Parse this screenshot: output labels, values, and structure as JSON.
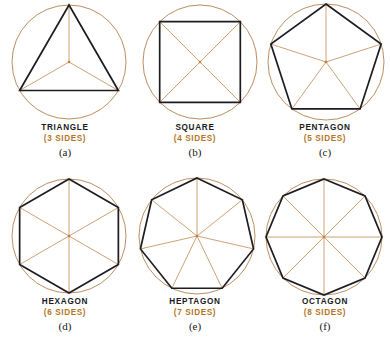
{
  "figure": {
    "background_color": "#ffffff",
    "circle_color": "#b07a44",
    "polygon_color": "#1c1c22",
    "radius_color": "#c08a52",
    "label_color": "#1a1a1a",
    "sides_label_color": "#b5761f",
    "panels": [
      {
        "id": "triangle",
        "name": "TRIANGLE",
        "sides_label": "(3 SIDES)",
        "letter": "(a)",
        "sides": 3,
        "center_x": 69,
        "center_y": 62,
        "radius": 57,
        "rotation_deg": -90,
        "show_radii": true
      },
      {
        "id": "square",
        "name": "SQUARE",
        "sides_label": "(4 SIDES)",
        "letter": "(b)",
        "sides": 4,
        "center_x": 70,
        "center_y": 62,
        "radius": 57,
        "rotation_deg": -135,
        "show_radii": true
      },
      {
        "id": "pentagon",
        "name": "PENTAGON",
        "sides_label": "(5 SIDES)",
        "letter": "(c)",
        "sides": 5,
        "center_x": 66,
        "center_y": 62,
        "radius": 58,
        "rotation_deg": -90,
        "show_radii": true
      },
      {
        "id": "hexagon",
        "name": "HEXAGON",
        "sides_label": "(6 SIDES)",
        "letter": "(d)",
        "sides": 6,
        "center_x": 69,
        "center_y": 62,
        "radius": 57,
        "rotation_deg": -90,
        "show_radii": true
      },
      {
        "id": "heptagon",
        "name": "HEPTAGON",
        "sides_label": "(7 SIDES)",
        "letter": "(e)",
        "sides": 7,
        "center_x": 67,
        "center_y": 62,
        "radius": 58,
        "rotation_deg": -90,
        "show_radii": true
      },
      {
        "id": "octagon",
        "name": "OCTAGON",
        "sides_label": "(8 SIDES)",
        "letter": "(f)",
        "sides": 8,
        "center_x": 64,
        "center_y": 63,
        "radius": 58,
        "rotation_deg": -90,
        "show_radii": true
      }
    ]
  },
  "chart_data": {
    "type": "table",
    "categories": [
      "TRIANGLE",
      "SQUARE",
      "PENTAGON",
      "HEXAGON",
      "HEPTAGON",
      "OCTAGON"
    ],
    "values": [
      3,
      4,
      5,
      6,
      7,
      8
    ],
    "labels": [
      "(a)",
      "(b)",
      "(c)",
      "(d)",
      "(e)",
      "(f)"
    ],
    "xlabel": "Polygon",
    "ylabel": "Number of sides",
    "legend": []
  }
}
